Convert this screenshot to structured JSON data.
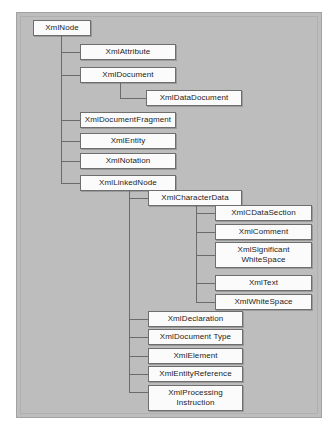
{
  "diagram": {
    "type": "class-hierarchy-tree",
    "panel_color": "#bdbdbd",
    "node_fill": "#fbfbfb",
    "node_border": "#6e6e6e",
    "connector_color": "#6b6b6b",
    "root": "XmlNode",
    "nodes": {
      "xml_node": "XmlNode",
      "xml_attribute": "XmlAttribute",
      "xml_document": "XmlDocument",
      "xml_data_document": "XmlDataDocument",
      "xml_document_fragment": "XmlDocumentFragment",
      "xml_entity": "XmlEntity",
      "xml_notation": "XmlNotation",
      "xml_linked_node": "XmlLinkedNode",
      "xml_character_data": "XmlCharacterData",
      "xml_cdata_section": "XmlCDataSection",
      "xml_comment": "XmlComment",
      "xml_significant_white_space": "XmlSignificant\nWhiteSpace",
      "xml_text": "XmlText",
      "xml_white_space": "XmlWhiteSpace",
      "xml_declaration": "XmlDeclaration",
      "xml_document_type": "XmlDocument Type",
      "xml_element": "XmlElement",
      "xml_entity_reference": "XmlEntityReference",
      "xml_processing_instruction": "XmlProcessing\nInstruction"
    },
    "hierarchy": {
      "XmlNode": [
        "XmlAttribute",
        "XmlDocument",
        "XmlDocumentFragment",
        "XmlEntity",
        "XmlNotation",
        "XmlLinkedNode"
      ],
      "XmlDocument": [
        "XmlDataDocument"
      ],
      "XmlLinkedNode": [
        "XmlCharacterData",
        "XmlDeclaration",
        "XmlDocument Type",
        "XmlElement",
        "XmlEntityReference",
        "XmlProcessing Instruction"
      ],
      "XmlCharacterData": [
        "XmlCDataSection",
        "XmlComment",
        "XmlSignificant WhiteSpace",
        "XmlText",
        "XmlWhiteSpace"
      ]
    }
  }
}
